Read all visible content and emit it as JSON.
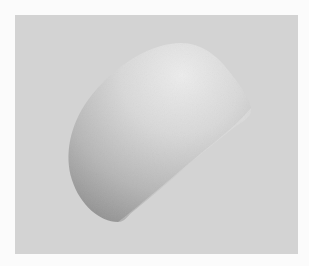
{
  "image": {
    "description": "Grayscale photograph of a smooth rounded dome-shaped object floating against a light gray backdrop, framed by a white border",
    "colors": {
      "border": "#fbfbfb",
      "background": "#d3d3d3",
      "object_highlight": "#e9e9e9",
      "object_mid": "#c4c4c4",
      "object_shadow": "#9a9a9a"
    }
  }
}
